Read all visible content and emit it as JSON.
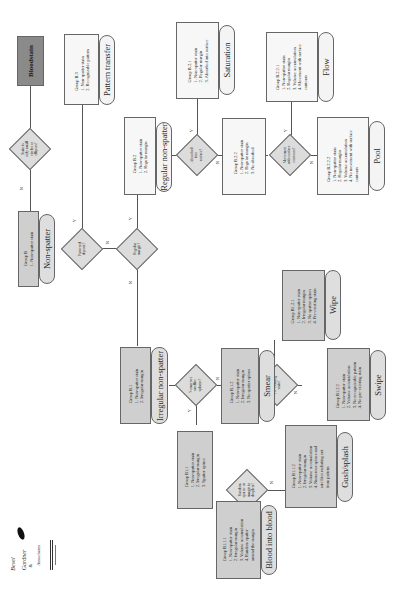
{
  "diagram": {
    "orientation": "rotated-90-ccw",
    "root": {
      "label": "Bloodstain"
    },
    "decisions": [
      {
        "id": "d1",
        "text": [
          "Stain is",
          "only small",
          "circles or",
          "ellipses?"
        ]
      },
      {
        "id": "d2",
        "text": [
          "Patterned",
          "deposit?"
        ]
      },
      {
        "id": "d3",
        "text": [
          "Regular",
          "margin?"
        ]
      },
      {
        "id": "d4",
        "text": [
          "Absorbed",
          "into",
          "surface?"
        ]
      },
      {
        "id": "d5",
        "text": [
          "Movement",
          "with surface",
          "contours?"
        ]
      },
      {
        "id": "d6",
        "text": [
          "Numerous",
          "satellite",
          "splatter?"
        ]
      },
      {
        "id": "d7",
        "text": [
          "Pre-existing",
          "stain?"
        ]
      },
      {
        "id": "d8",
        "text": [
          "Random",
          "spatter on",
          "margin in",
          "droplets?"
        ]
      }
    ],
    "branch_labels": {
      "yes": "Y",
      "no": "N"
    },
    "groups": [
      {
        "id": "B",
        "title": "Group B",
        "items": [
          "1. Non-spatter stain"
        ],
        "category": "Non-spatter"
      },
      {
        "id": "B.3",
        "title": "Group B.3",
        "items": [
          "1. Non-spatter stain",
          "2. Recognizable pattern"
        ],
        "category": "Pattern transfer"
      },
      {
        "id": "B.2",
        "title": "Group B.2",
        "items": [
          "1. Non-spatter stain",
          "2. Regular margin"
        ],
        "category": "Regular non-spatter"
      },
      {
        "id": "B.2.1",
        "title": "Group B.2.1",
        "items": [
          "1. Non-spatter stain",
          "2. Regular margin",
          "3. Absorbed into surface"
        ],
        "category": "Saturation"
      },
      {
        "id": "B.2.2",
        "title": "Group B.2.2",
        "items": [
          "1. Non-spatter stain",
          "2. Regular margin",
          "3. No absorbed"
        ],
        "category": ""
      },
      {
        "id": "B.2.2.1",
        "title": "Group B.2.2.1",
        "items": [
          "1. Non-spatter stain",
          "2. Regular margin",
          "3. Volume accumulation",
          "4. Movement with surface",
          "    contours"
        ],
        "category": "Flow"
      },
      {
        "id": "B.2.2.2",
        "title": "Group B.2.2.2",
        "items": [
          "1. Non-spatter stain",
          "2. Regular margin",
          "3. Volume accumulation",
          "4. No movement with surface",
          "    contours"
        ],
        "category": "Pool"
      },
      {
        "id": "B.1",
        "title": "Group B.1",
        "items": [
          "1. Non-spatter stain",
          "2. Irregular margin"
        ],
        "category": "Irregular non-spatter"
      },
      {
        "id": "B.1.2",
        "title": "Group B.1.2",
        "items": [
          "1. Non-spatter stain",
          "2. Irregular margin",
          "3. No spatter spines"
        ],
        "category": "Smear"
      },
      {
        "id": "B.1.2.1",
        "title": "Group B1.2.1",
        "items": [
          "1. Non-spatter stain",
          "2. Irregular margin",
          "3. No spatter spines",
          "4. Pre-existing stain"
        ],
        "category": "Wipe"
      },
      {
        "id": "B.1.2.2",
        "title": "Group B1.2.2",
        "items": [
          "1. Non-spatter stain",
          "2. Volume accumulation",
          "3. No recognizable pattern",
          "4. No pre-existing stain"
        ],
        "category": "Swipe"
      },
      {
        "id": "B.1.1",
        "title": "Group B1.1",
        "items": [
          "1. Non-spatter stain",
          "2. Irregular margin",
          "3. Spatter spines"
        ],
        "category": ""
      },
      {
        "id": "B.1.1.1",
        "title": "Group B1.1.1",
        "items": [
          "1. Non-spatter stain",
          "2. Irregular margin",
          "3. Volume accumulation",
          "4. Random spatter",
          "    around the margin"
        ],
        "category": "Blood into blood"
      },
      {
        "id": "B.1.1.2",
        "title": "Group B1.1.2",
        "items": [
          "1. Non-spatter stain",
          "2. Irregular margin",
          "3. Volume accumulation",
          "4. Numerous spines and",
          "    satellites radiating out",
          "    from pattern"
        ],
        "category": "Gush/splash"
      }
    ],
    "logo": {
      "lines": [
        "Bevel",
        "Gardner",
        "&",
        "Associates"
      ]
    }
  }
}
